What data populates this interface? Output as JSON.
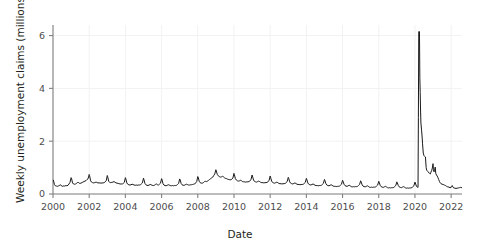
{
  "chart_data": {
    "type": "line",
    "title": "",
    "xlabel": "Date",
    "ylabel": "Weekly unemployment claims (millions)",
    "xlim": [
      2000.0,
      2022.6
    ],
    "ylim": [
      0,
      6.4
    ],
    "xticks": [
      2000,
      2002,
      2004,
      2006,
      2008,
      2010,
      2012,
      2014,
      2016,
      2018,
      2020,
      2022
    ],
    "xtick_labels": [
      "2000",
      "2002",
      "2004",
      "2006",
      "2008",
      "2010",
      "2012",
      "2014",
      "2016",
      "2018",
      "2020",
      "2022"
    ],
    "yticks": [
      0,
      2,
      4,
      6
    ],
    "ytick_labels": [
      "0",
      "2",
      "4",
      "6"
    ],
    "grid": true,
    "grid_color": "#f2f2f2",
    "line_color": "#1a1a1a",
    "line_width": 1.0,
    "legend": "none",
    "annotations": [],
    "series": [
      {
        "name": "Weekly unemployment claims (millions)",
        "units": "millions",
        "x": [
          2000.02,
          2000.08,
          2000.13,
          2000.19,
          2000.25,
          2000.31,
          2000.37,
          2000.42,
          2000.48,
          2000.54,
          2000.6,
          2000.65,
          2000.71,
          2000.77,
          2000.83,
          2000.88,
          2000.94,
          2001.0,
          2001.02,
          2001.08,
          2001.13,
          2001.19,
          2001.25,
          2001.31,
          2001.37,
          2001.42,
          2001.48,
          2001.54,
          2001.6,
          2001.65,
          2001.71,
          2001.77,
          2001.83,
          2001.88,
          2001.94,
          2002.0,
          2002.02,
          2002.08,
          2002.13,
          2002.19,
          2002.25,
          2002.31,
          2002.37,
          2002.42,
          2002.48,
          2002.54,
          2002.6,
          2002.65,
          2002.71,
          2002.77,
          2002.83,
          2002.88,
          2002.94,
          2003.0,
          2003.02,
          2003.08,
          2003.13,
          2003.19,
          2003.25,
          2003.31,
          2003.37,
          2003.42,
          2003.48,
          2003.54,
          2003.6,
          2003.65,
          2003.71,
          2003.77,
          2003.83,
          2003.88,
          2003.94,
          2004.0,
          2004.02,
          2004.08,
          2004.13,
          2004.19,
          2004.25,
          2004.31,
          2004.37,
          2004.42,
          2004.48,
          2004.54,
          2004.6,
          2004.65,
          2004.71,
          2004.77,
          2004.83,
          2004.88,
          2004.94,
          2005.0,
          2005.02,
          2005.08,
          2005.13,
          2005.19,
          2005.25,
          2005.31,
          2005.37,
          2005.42,
          2005.48,
          2005.54,
          2005.6,
          2005.65,
          2005.71,
          2005.77,
          2005.83,
          2005.88,
          2005.94,
          2006.0,
          2006.02,
          2006.08,
          2006.13,
          2006.19,
          2006.25,
          2006.31,
          2006.37,
          2006.42,
          2006.48,
          2006.54,
          2006.6,
          2006.65,
          2006.71,
          2006.77,
          2006.83,
          2006.88,
          2006.94,
          2007.0,
          2007.02,
          2007.08,
          2007.13,
          2007.19,
          2007.25,
          2007.31,
          2007.37,
          2007.42,
          2007.48,
          2007.54,
          2007.6,
          2007.65,
          2007.71,
          2007.77,
          2007.83,
          2007.88,
          2007.94,
          2008.0,
          2008.02,
          2008.08,
          2008.13,
          2008.19,
          2008.25,
          2008.31,
          2008.37,
          2008.42,
          2008.48,
          2008.54,
          2008.6,
          2008.65,
          2008.71,
          2008.77,
          2008.83,
          2008.88,
          2008.94,
          2009.0,
          2009.02,
          2009.08,
          2009.13,
          2009.19,
          2009.25,
          2009.31,
          2009.37,
          2009.42,
          2009.48,
          2009.54,
          2009.6,
          2009.65,
          2009.71,
          2009.77,
          2009.83,
          2009.88,
          2009.94,
          2010.0,
          2010.02,
          2010.08,
          2010.13,
          2010.19,
          2010.25,
          2010.31,
          2010.37,
          2010.42,
          2010.48,
          2010.54,
          2010.6,
          2010.65,
          2010.71,
          2010.77,
          2010.83,
          2010.88,
          2010.94,
          2011.0,
          2011.02,
          2011.08,
          2011.13,
          2011.19,
          2011.25,
          2011.31,
          2011.37,
          2011.42,
          2011.48,
          2011.54,
          2011.6,
          2011.65,
          2011.71,
          2011.77,
          2011.83,
          2011.88,
          2011.94,
          2012.0,
          2012.02,
          2012.08,
          2012.13,
          2012.19,
          2012.25,
          2012.31,
          2012.37,
          2012.42,
          2012.48,
          2012.54,
          2012.6,
          2012.65,
          2012.71,
          2012.77,
          2012.83,
          2012.88,
          2012.94,
          2013.0,
          2013.02,
          2013.08,
          2013.13,
          2013.19,
          2013.25,
          2013.31,
          2013.37,
          2013.42,
          2013.48,
          2013.54,
          2013.6,
          2013.65,
          2013.71,
          2013.77,
          2013.83,
          2013.88,
          2013.94,
          2014.0,
          2014.02,
          2014.08,
          2014.13,
          2014.19,
          2014.25,
          2014.31,
          2014.37,
          2014.42,
          2014.48,
          2014.54,
          2014.6,
          2014.65,
          2014.71,
          2014.77,
          2014.83,
          2014.88,
          2014.94,
          2015.0,
          2015.02,
          2015.08,
          2015.13,
          2015.19,
          2015.25,
          2015.31,
          2015.37,
          2015.42,
          2015.48,
          2015.54,
          2015.6,
          2015.65,
          2015.71,
          2015.77,
          2015.83,
          2015.88,
          2015.94,
          2016.0,
          2016.02,
          2016.08,
          2016.13,
          2016.19,
          2016.25,
          2016.31,
          2016.37,
          2016.42,
          2016.48,
          2016.54,
          2016.6,
          2016.65,
          2016.71,
          2016.77,
          2016.83,
          2016.88,
          2016.94,
          2017.0,
          2017.02,
          2017.08,
          2017.13,
          2017.19,
          2017.25,
          2017.31,
          2017.37,
          2017.42,
          2017.48,
          2017.54,
          2017.6,
          2017.65,
          2017.71,
          2017.77,
          2017.83,
          2017.88,
          2017.94,
          2018.0,
          2018.02,
          2018.08,
          2018.13,
          2018.19,
          2018.25,
          2018.31,
          2018.37,
          2018.42,
          2018.48,
          2018.54,
          2018.6,
          2018.65,
          2018.71,
          2018.77,
          2018.83,
          2018.88,
          2018.94,
          2019.0,
          2019.02,
          2019.08,
          2019.13,
          2019.19,
          2019.25,
          2019.31,
          2019.37,
          2019.42,
          2019.48,
          2019.54,
          2019.6,
          2019.65,
          2019.71,
          2019.77,
          2019.83,
          2019.88,
          2019.94,
          2020.0,
          2020.02,
          2020.08,
          2020.13,
          2020.17,
          2020.19,
          2020.21,
          2020.23,
          2020.25,
          2020.27,
          2020.29,
          2020.31,
          2020.33,
          2020.37,
          2020.4,
          2020.42,
          2020.46,
          2020.5,
          2020.54,
          2020.58,
          2020.62,
          2020.65,
          2020.69,
          2020.73,
          2020.77,
          2020.81,
          2020.85,
          2020.88,
          2020.92,
          2020.96,
          2021.0,
          2021.02,
          2021.04,
          2021.06,
          2021.08,
          2021.12,
          2021.15,
          2021.19,
          2021.23,
          2021.27,
          2021.31,
          2021.35,
          2021.4,
          2021.44,
          2021.5,
          2021.56,
          2021.62,
          2021.69,
          2021.75,
          2021.81,
          2021.88,
          2021.94,
          2022.0,
          2022.02,
          2022.06,
          2022.1,
          2022.15,
          2022.21,
          2022.27,
          2022.33,
          2022.4,
          2022.46,
          2022.52,
          2022.58
        ],
        "y": [
          0.52,
          0.36,
          0.31,
          0.3,
          0.29,
          0.31,
          0.33,
          0.35,
          0.3,
          0.29,
          0.31,
          0.3,
          0.32,
          0.31,
          0.33,
          0.38,
          0.44,
          0.62,
          0.6,
          0.42,
          0.38,
          0.37,
          0.38,
          0.41,
          0.44,
          0.43,
          0.4,
          0.41,
          0.43,
          0.45,
          0.47,
          0.49,
          0.51,
          0.55,
          0.58,
          0.74,
          0.7,
          0.5,
          0.45,
          0.43,
          0.42,
          0.43,
          0.45,
          0.44,
          0.42,
          0.42,
          0.42,
          0.41,
          0.42,
          0.42,
          0.43,
          0.46,
          0.5,
          0.7,
          0.66,
          0.48,
          0.44,
          0.43,
          0.44,
          0.45,
          0.47,
          0.45,
          0.42,
          0.41,
          0.4,
          0.39,
          0.38,
          0.38,
          0.38,
          0.4,
          0.44,
          0.62,
          0.58,
          0.42,
          0.37,
          0.35,
          0.34,
          0.35,
          0.37,
          0.36,
          0.34,
          0.33,
          0.34,
          0.33,
          0.34,
          0.34,
          0.35,
          0.38,
          0.42,
          0.6,
          0.56,
          0.4,
          0.35,
          0.33,
          0.32,
          0.34,
          0.36,
          0.35,
          0.33,
          0.32,
          0.33,
          0.36,
          0.38,
          0.35,
          0.34,
          0.37,
          0.41,
          0.58,
          0.55,
          0.39,
          0.34,
          0.32,
          0.31,
          0.33,
          0.35,
          0.34,
          0.32,
          0.31,
          0.32,
          0.31,
          0.32,
          0.32,
          0.33,
          0.36,
          0.4,
          0.57,
          0.55,
          0.4,
          0.35,
          0.33,
          0.33,
          0.35,
          0.37,
          0.36,
          0.34,
          0.34,
          0.35,
          0.35,
          0.36,
          0.37,
          0.38,
          0.42,
          0.47,
          0.66,
          0.64,
          0.48,
          0.43,
          0.41,
          0.41,
          0.43,
          0.47,
          0.48,
          0.47,
          0.49,
          0.52,
          0.55,
          0.58,
          0.61,
          0.64,
          0.7,
          0.76,
          0.92,
          0.88,
          0.74,
          0.69,
          0.66,
          0.64,
          0.65,
          0.67,
          0.65,
          0.61,
          0.59,
          0.58,
          0.56,
          0.55,
          0.54,
          0.54,
          0.56,
          0.6,
          0.78,
          0.74,
          0.58,
          0.53,
          0.5,
          0.49,
          0.5,
          0.52,
          0.5,
          0.47,
          0.46,
          0.46,
          0.45,
          0.46,
          0.46,
          0.47,
          0.5,
          0.54,
          0.72,
          0.68,
          0.53,
          0.48,
          0.46,
          0.45,
          0.47,
          0.49,
          0.47,
          0.44,
          0.43,
          0.43,
          0.42,
          0.43,
          0.43,
          0.44,
          0.47,
          0.51,
          0.68,
          0.64,
          0.49,
          0.44,
          0.42,
          0.41,
          0.43,
          0.45,
          0.43,
          0.4,
          0.39,
          0.39,
          0.38,
          0.39,
          0.39,
          0.4,
          0.43,
          0.47,
          0.63,
          0.6,
          0.46,
          0.41,
          0.39,
          0.38,
          0.4,
          0.42,
          0.4,
          0.37,
          0.36,
          0.36,
          0.35,
          0.36,
          0.36,
          0.37,
          0.4,
          0.44,
          0.59,
          0.56,
          0.42,
          0.37,
          0.35,
          0.34,
          0.36,
          0.38,
          0.36,
          0.33,
          0.32,
          0.32,
          0.31,
          0.32,
          0.32,
          0.33,
          0.36,
          0.4,
          0.55,
          0.52,
          0.39,
          0.34,
          0.32,
          0.31,
          0.33,
          0.35,
          0.33,
          0.3,
          0.29,
          0.29,
          0.28,
          0.29,
          0.29,
          0.3,
          0.33,
          0.37,
          0.52,
          0.49,
          0.37,
          0.32,
          0.3,
          0.29,
          0.31,
          0.33,
          0.31,
          0.28,
          0.27,
          0.28,
          0.27,
          0.28,
          0.28,
          0.29,
          0.32,
          0.36,
          0.5,
          0.47,
          0.35,
          0.3,
          0.28,
          0.27,
          0.29,
          0.31,
          0.29,
          0.26,
          0.25,
          0.26,
          0.25,
          0.26,
          0.26,
          0.27,
          0.3,
          0.34,
          0.48,
          0.45,
          0.33,
          0.28,
          0.26,
          0.25,
          0.27,
          0.29,
          0.27,
          0.24,
          0.23,
          0.24,
          0.23,
          0.24,
          0.24,
          0.25,
          0.28,
          0.32,
          0.46,
          0.43,
          0.32,
          0.27,
          0.25,
          0.24,
          0.26,
          0.28,
          0.26,
          0.23,
          0.22,
          0.23,
          0.22,
          0.23,
          0.23,
          0.24,
          0.27,
          0.31,
          0.45,
          0.42,
          0.3,
          0.26,
          0.25,
          2.9,
          6.15,
          6.15,
          6.15,
          4.4,
          3.85,
          3.18,
          2.69,
          2.39,
          2.12,
          1.9,
          1.55,
          1.45,
          1.42,
          1.4,
          1.0,
          0.9,
          0.87,
          0.84,
          0.8,
          0.78,
          0.76,
          0.82,
          0.88,
          0.98,
          1.15,
          0.92,
          0.86,
          0.84,
          0.88,
          1.02,
          0.78,
          0.72,
          0.68,
          0.62,
          0.55,
          0.48,
          0.42,
          0.39,
          0.37,
          0.36,
          0.34,
          0.32,
          0.29,
          0.27,
          0.26,
          0.24,
          0.25,
          0.29,
          0.32,
          0.26,
          0.23,
          0.22,
          0.21,
          0.22,
          0.23,
          0.24,
          0.25,
          0.24
        ]
      }
    ]
  }
}
